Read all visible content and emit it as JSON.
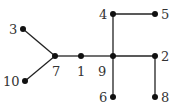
{
  "graph": {
    "type": "tree",
    "node_color": "#111111",
    "edge_color": "#222222",
    "nodes": [
      {
        "id": "3",
        "x": 23,
        "y": 29,
        "lx": 9,
        "ly": 34
      },
      {
        "id": "10",
        "x": 25,
        "y": 81,
        "lx": 3,
        "ly": 86
      },
      {
        "id": "7",
        "x": 55,
        "y": 56,
        "lx": 52,
        "ly": 76
      },
      {
        "id": "1",
        "x": 81,
        "y": 56,
        "lx": 77,
        "ly": 76
      },
      {
        "id": "9",
        "x": 113,
        "y": 56,
        "lx": 98,
        "ly": 76
      },
      {
        "id": "4",
        "x": 113,
        "y": 14,
        "lx": 99,
        "ly": 19
      },
      {
        "id": "5",
        "x": 155,
        "y": 14,
        "lx": 161,
        "ly": 19
      },
      {
        "id": "2",
        "x": 155,
        "y": 56,
        "lx": 161,
        "ly": 61
      },
      {
        "id": "6",
        "x": 113,
        "y": 97,
        "lx": 99,
        "ly": 102
      },
      {
        "id": "8",
        "x": 155,
        "y": 97,
        "lx": 161,
        "ly": 102
      }
    ],
    "edges": [
      [
        "3",
        "7"
      ],
      [
        "10",
        "7"
      ],
      [
        "7",
        "1"
      ],
      [
        "1",
        "9"
      ],
      [
        "9",
        "4"
      ],
      [
        "4",
        "5"
      ],
      [
        "9",
        "2"
      ],
      [
        "2",
        "8"
      ],
      [
        "9",
        "6"
      ]
    ]
  }
}
